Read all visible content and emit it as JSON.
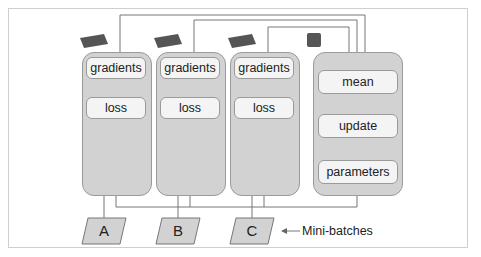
{
  "diagram": {
    "workers": [
      {
        "id": "gpu-1",
        "gradients": "gradients",
        "loss": "loss",
        "batch": "A"
      },
      {
        "id": "gpu-2",
        "gradients": "gradients",
        "loss": "loss",
        "batch": "B"
      },
      {
        "id": "gpu-3",
        "gradients": "gradients",
        "loss": "loss",
        "batch": "C"
      }
    ],
    "server": {
      "steps": [
        "mean",
        "update",
        "parameters"
      ]
    },
    "annotation": "Mini-batches",
    "icons": {
      "worker": "gpu-card-icon",
      "server": "cpu-chip-icon"
    },
    "colors": {
      "panel": "#d2d2d2",
      "box": "#f4f4f4",
      "line": "#7a7a7a"
    }
  }
}
